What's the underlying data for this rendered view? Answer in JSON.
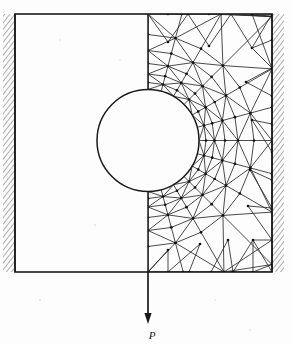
{
  "figure": {
    "type": "engineering-diagram",
    "background_color": "#fdfdfd",
    "line_color": "#1a1a1a",
    "mesh_color": "#2a2a2a",
    "node_color": "#111111"
  },
  "labels": {
    "load": "P"
  },
  "geometry": {
    "canvas": {
      "width": 292,
      "height": 345
    },
    "plate": {
      "x": 15,
      "y": 14,
      "width": 257,
      "height": 258
    },
    "hole": {
      "cx": 148,
      "cy": 140.5,
      "r": 51
    },
    "symmetry_line_x": 148,
    "supports": [
      {
        "name": "left-fixed-support",
        "x": 3,
        "y": 14,
        "width": 12,
        "height": 258,
        "side": "left"
      },
      {
        "name": "right-fixed-support",
        "x": 272,
        "y": 14,
        "width": 12,
        "height": 258,
        "side": "right"
      }
    ],
    "load_arrow": {
      "x": 148,
      "y_start": 272,
      "y_end": 322,
      "direction": "down"
    },
    "label_position": {
      "x": 152,
      "y": 337
    }
  },
  "mesh": {
    "meshed_half": "right",
    "element_type": "triangle",
    "grading": "fine-near-hole-coarse-at-boundary",
    "radial_rings_r": [
      51,
      58,
      66.5,
      77,
      90,
      106,
      126
    ],
    "ring_angles_deg": [
      -90,
      -75,
      -60,
      -45,
      -30,
      -15,
      0,
      15,
      30,
      45,
      60,
      75,
      90
    ],
    "outer_nodes_top": [
      [
        148,
        14
      ],
      [
        168,
        14
      ],
      [
        188,
        14
      ],
      [
        209,
        14
      ],
      [
        231,
        14
      ],
      [
        252,
        14
      ],
      [
        272,
        14
      ]
    ],
    "outer_nodes_right": [
      [
        272,
        14
      ],
      [
        272,
        40
      ],
      [
        272,
        68
      ],
      [
        272,
        96
      ],
      [
        272,
        124
      ],
      [
        272,
        152
      ],
      [
        272,
        180
      ],
      [
        272,
        208
      ],
      [
        272,
        240
      ],
      [
        272,
        272
      ]
    ],
    "outer_nodes_bottom": [
      [
        148,
        272
      ],
      [
        168,
        272
      ],
      [
        189,
        272
      ],
      [
        211,
        272
      ],
      [
        233,
        272
      ],
      [
        253,
        272
      ],
      [
        272,
        272
      ]
    ],
    "symmetry_nodes": [
      [
        148,
        14
      ],
      [
        148,
        34
      ],
      [
        148,
        54
      ],
      [
        148,
        72
      ],
      [
        148,
        89
      ],
      [
        148,
        192
      ],
      [
        148,
        210
      ],
      [
        148,
        230
      ],
      [
        148,
        251
      ],
      [
        148,
        272
      ]
    ]
  },
  "chart_data": {
    "type": "diagram",
    "annotations": [
      "P"
    ]
  }
}
